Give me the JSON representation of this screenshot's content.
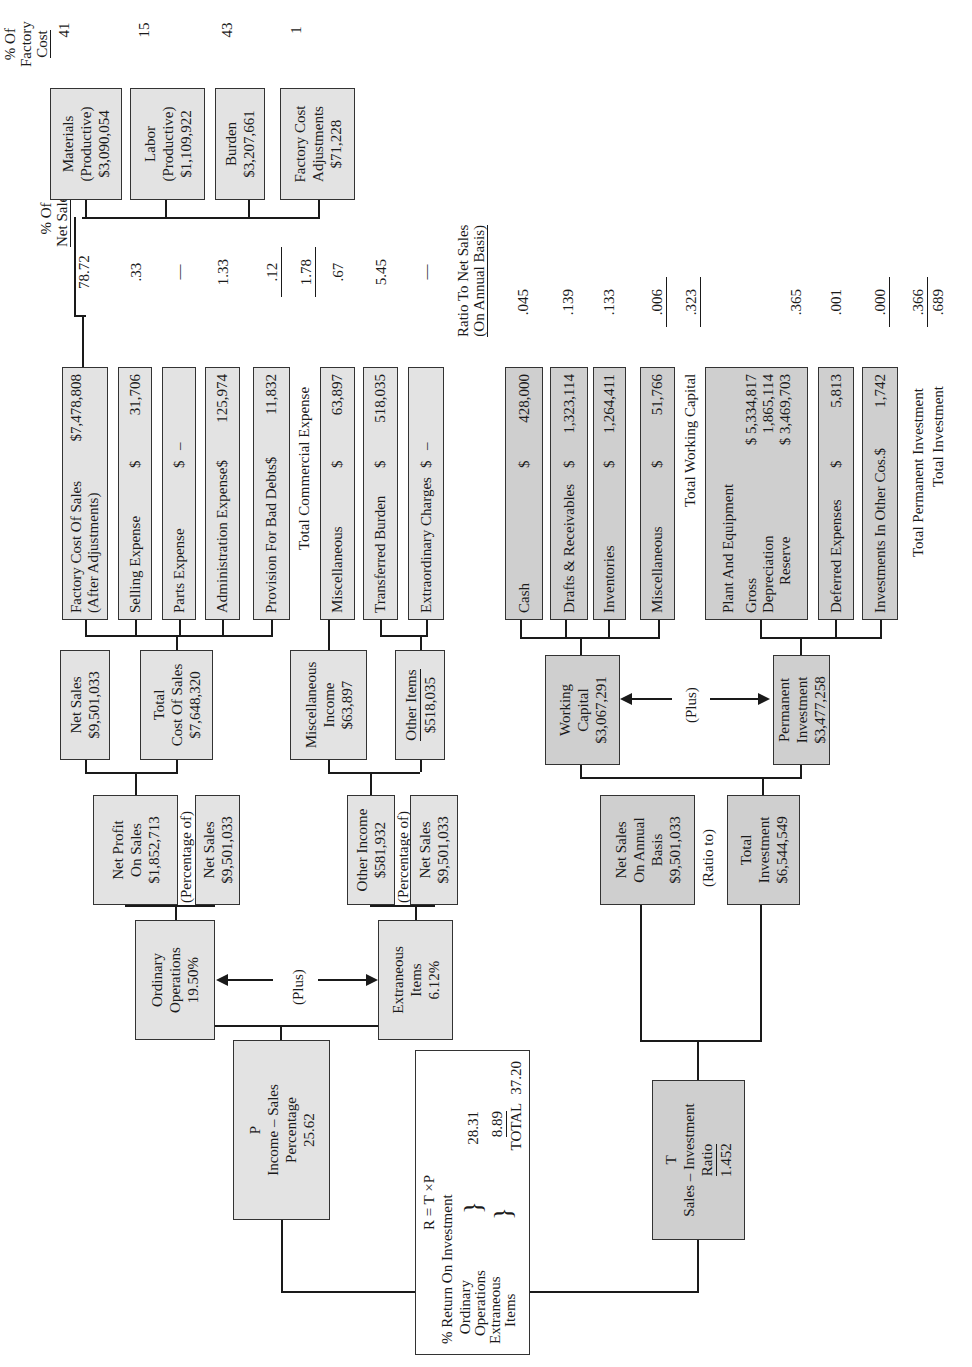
{
  "roi": {
    "formula": "R = T ×P",
    "caption": "% Return On Investment",
    "ordinary_label_1": "Ordinary",
    "ordinary_label_2": "Operations",
    "ordinary_value": "28.31",
    "extraneous_label_1": "Extraneous",
    "extraneous_label_2": "Items",
    "extraneous_value": "8.89",
    "total_label": "TOTAL",
    "total_value": "37.20"
  },
  "p_box": {
    "letter": "P",
    "line1": "Income – Sales",
    "line2": "Percentage",
    "value": "25.62"
  },
  "t_box": {
    "letter": "T",
    "line1": "Sales – Investment",
    "line2": "Ratio",
    "value": "1.452"
  },
  "ordinary_ops": {
    "line1": "Ordinary",
    "line2": "Operations",
    "value": "19.50%"
  },
  "extraneous": {
    "line1": "Extraneous",
    "line2": "Items",
    "value": "6.12%"
  },
  "plus_label": "(Plus)",
  "percentage_of_label": "(Percentage of)",
  "ratio_to_label": "(Ratio to)",
  "net_profit": {
    "line1": "Net Profit",
    "line2": "On Sales",
    "value": "$1,852,713"
  },
  "net_sales_a": {
    "line1": "Net Sales",
    "value": "$9,501,033"
  },
  "other_income": {
    "line1": "Other Income",
    "value": "$581,932"
  },
  "net_sales_b": {
    "line1": "Net Sales",
    "value": "$9,501,033"
  },
  "net_sales_top": {
    "line1": "Net Sales",
    "value": "$9,501,033"
  },
  "total_cost": {
    "line1": "Total",
    "line2": "Cost Of Sales",
    "value": "$7,648,320"
  },
  "misc_income": {
    "line1": "Miscellaneous",
    "line2": "Income",
    "value": "$63,897"
  },
  "other_items": {
    "line1": "Other Items",
    "value": "$518,035"
  },
  "ns_annual": {
    "line1": "Net Sales",
    "line2": "On Annual",
    "line3": "Basis",
    "value": "$9,501,033"
  },
  "total_investment": {
    "line1": "Total",
    "line2": "Investment",
    "value": "$6,544,549"
  },
  "working_capital": {
    "line1": "Working",
    "line2": "Capital",
    "value": "$3,067,291"
  },
  "permanent_investment": {
    "line1": "Permanent",
    "line2": "Investment",
    "value": "$3,477,258"
  },
  "cost_items": [
    {
      "label": "Factory Cost Of Sales",
      "sub": "(After Adjustments)",
      "cur": "",
      "amount": "$7,478,808",
      "pct": "78.72"
    },
    {
      "label": "Selling Expense",
      "cur": "$",
      "amount": "31,706",
      "pct": ".33"
    },
    {
      "label": "Parts Expense",
      "cur": "$",
      "amount": "–",
      "pct": "—"
    },
    {
      "label": "Administration Expense",
      "cur": "$",
      "amount": "125,974",
      "pct": "1.33"
    },
    {
      "label": "Provision For Bad Debts",
      "cur": "$",
      "amount": "11,832",
      "pct": ".12"
    }
  ],
  "total_commercial_expense": {
    "label": "Total Commercial Expense",
    "pct": "1.78"
  },
  "other_items_detail": [
    {
      "label": "Miscellaneous",
      "cur": "$",
      "amount": "63,897",
      "pct": ".67"
    },
    {
      "label": "Transferred Burden",
      "cur": "$",
      "amount": "518,035",
      "pct": "5.45"
    },
    {
      "label": "Extraordinary Charges",
      "cur": "$",
      "amount": "–",
      "pct": "—"
    }
  ],
  "pct_net_sales_header_1": "% Of",
  "pct_net_sales_header_2": "Net Sales",
  "ratio_header_1": "Ratio To Net Sales",
  "ratio_header_2": "(On Annual Basis)",
  "working_items": [
    {
      "label": "Cash",
      "cur": "$",
      "amount": "428,000",
      "ratio": ".045"
    },
    {
      "label": "Drafts & Receivables",
      "cur": "$",
      "amount": "1,323,114",
      "ratio": ".139"
    },
    {
      "label": "Inventories",
      "cur": "$",
      "amount": "1,264,411",
      "ratio": ".133"
    },
    {
      "label": "Miscellaneous",
      "cur": "$",
      "amount": "51,766",
      "ratio": ".006"
    }
  ],
  "total_working_capital": {
    "label": "Total Working Capital",
    "ratio": ".323"
  },
  "plant": {
    "title": "Plant And Equipment",
    "gross_label": "Gross",
    "gross_value": "$ 5,334,817",
    "dep_label": "Depreciation",
    "dep_value": "1,865,114",
    "reserve_label": "Reserve",
    "reserve_value": "$ 3,469,703",
    "ratio": ".365"
  },
  "permanent_items": [
    {
      "label": "Deferred Expenses",
      "cur": "$",
      "amount": "5,813",
      "ratio": ".001"
    },
    {
      "label": "Investments In Other Cos.",
      "cur": "$",
      "amount": "1,742",
      "ratio": ".000"
    }
  ],
  "total_permanent_investment": {
    "label": "Total Permanent Investment",
    "ratio": ".366"
  },
  "total_investment_ratio": {
    "label": "Total Investment",
    "ratio": ".689"
  },
  "factory_header_1": "% Of",
  "factory_header_2": "Factory",
  "factory_header_3": "Cost",
  "factory_items": [
    {
      "line1": "Materials",
      "line2": "(Productive)",
      "value": "$3,090,054",
      "pct": "41"
    },
    {
      "line1": "Labor",
      "line2": "(Productive)",
      "value": "$1,109,922",
      "pct": "15"
    },
    {
      "line1": "Burden",
      "line2": "",
      "value": "$3,207,661",
      "pct": "43"
    },
    {
      "line1": "Factory Cost",
      "line2": "Adjustments",
      "value": "$71,228",
      "pct": "1"
    }
  ]
}
